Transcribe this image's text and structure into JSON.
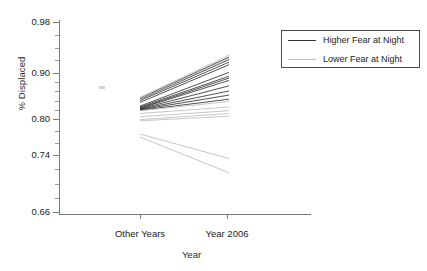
{
  "chart_data": {
    "type": "line",
    "title": "",
    "xlabel": "Year",
    "ylabel": "% Displaced",
    "x": [
      "Other Years",
      "Year 2006"
    ],
    "xtick_labels": [
      "Other Years",
      "Year 2006"
    ],
    "ytick_labels": [
      "0.98",
      "0.90",
      "0.80",
      "0.74",
      "0.66"
    ],
    "ytick_values": [
      0.98,
      0.9,
      0.8,
      0.74,
      0.66
    ],
    "ylim": [
      0.66,
      0.98
    ],
    "grid": false,
    "legend_position": "top-right",
    "legend": [
      "Higher Fear at Night",
      "Lower Fear at Night"
    ],
    "note": "Interaction plot: each line connects one group's % displaced in Other Years vs Year 2006.",
    "series": [
      {
        "name": "Higher Fear at Night",
        "color": "#333333",
        "lines": [
          {
            "values": [
              0.845,
              0.925
            ]
          },
          {
            "values": [
              0.843,
              0.921
            ]
          },
          {
            "values": [
              0.84,
              0.917
            ]
          },
          {
            "values": [
              0.836,
              0.913
            ]
          },
          {
            "values": [
              0.828,
              0.901
            ]
          },
          {
            "values": [
              0.826,
              0.893
            ]
          },
          {
            "values": [
              0.824,
              0.889
            ]
          },
          {
            "values": [
              0.823,
              0.884
            ]
          },
          {
            "values": [
              0.822,
              0.872
            ]
          },
          {
            "values": [
              0.821,
              0.861
            ]
          },
          {
            "values": [
              0.82,
              0.852
            ]
          },
          {
            "values": [
              0.819,
              0.843
            ]
          }
        ]
      },
      {
        "name": "Lower Fear at Night",
        "color": "#b9b9b9",
        "lines": [
          {
            "values": [
              0.847,
              0.928
            ]
          },
          {
            "values": [
              0.844,
              0.923
            ]
          },
          {
            "values": [
              0.818,
              0.838
            ]
          },
          {
            "values": [
              0.812,
              0.826
            ]
          },
          {
            "values": [
              0.805,
              0.818
            ]
          },
          {
            "values": [
              0.799,
              0.812
            ]
          },
          {
            "values": [
              0.797,
              0.806
            ]
          },
          {
            "values": [
              0.775,
              0.735
            ]
          },
          {
            "values": [
              0.77,
              0.715
            ]
          }
        ]
      }
    ]
  },
  "axes": {
    "ylabel": "% Displaced",
    "xlabel": "Year",
    "yticks": [
      {
        "label": "0.98",
        "value": 0.98
      },
      {
        "label": "0.90",
        "value": 0.9
      },
      {
        "label": "0.80",
        "value": 0.8
      },
      {
        "label": "0.74",
        "value": 0.74
      },
      {
        "label": "0.66",
        "value": 0.66
      }
    ],
    "xticks": [
      {
        "label": "Other Years"
      },
      {
        "label": "Year 2006"
      }
    ]
  },
  "legend": {
    "entries": [
      {
        "label": "Higher Fear at Night",
        "color": "#333333"
      },
      {
        "label": "Lower Fear at Night",
        "color": "#bcbcbc"
      }
    ]
  }
}
